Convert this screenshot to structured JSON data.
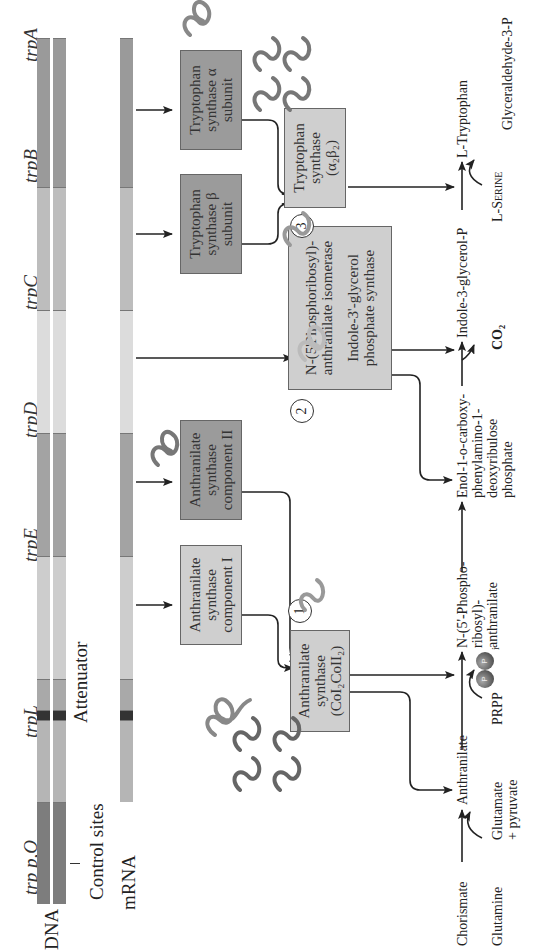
{
  "figure": {
    "orientation": "rotated-90-ccw",
    "dna": {
      "label": "DNA",
      "genes": [
        {
          "id": "trpPO",
          "label": "trp p,O",
          "color": "#7d7d7d"
        },
        {
          "id": "trpL",
          "label": "trpL",
          "color": "#b5b5b5"
        },
        {
          "id": "attenuator",
          "label": "",
          "color": "#333333"
        },
        {
          "id": "trpL2",
          "label": "",
          "color": "#a9a9a9"
        },
        {
          "id": "trpE",
          "label": "trpE",
          "color": "#cdcdcd"
        },
        {
          "id": "trpD",
          "label": "trpD",
          "color": "#a3a3a3"
        },
        {
          "id": "trpC",
          "label": "trpC",
          "color": "#dcdcdc"
        },
        {
          "id": "trpB",
          "label": "trpB",
          "color": "#bdbdbd"
        },
        {
          "id": "trpA",
          "label": "trpA",
          "color": "#9a9a9a"
        }
      ],
      "control_sites_label": "Control sites",
      "attenuator_label": "Attenuator"
    },
    "mrna": {
      "label": "mRNA"
    },
    "enzymes": {
      "as_comp1": "Anthranilate synthase component I",
      "as_comp2": "Anthranilate synthase component II",
      "as_complex_l1": "Anthranilate",
      "as_complex_l2": "synthase",
      "as_complex_l3": "(CoI₂CoII₂)",
      "prai_l1": "N-(5'Phosphoribosyl)-",
      "prai_l2": "anthranilate isomerase",
      "igps_l1": "Indole-3'-glycerol",
      "igps_l2": "phosphate synthase",
      "ts_beta": "Tryptophan synthase β subunit",
      "ts_alpha": "Tryptophan synthase α subunit",
      "ts_complex_l1": "Tryptophan",
      "ts_complex_l2": "synthase",
      "ts_complex_l3": "(α₂β₂)"
    },
    "step_numbers": [
      "1",
      "2",
      "3"
    ],
    "pathway": {
      "chorismate": "Chorismate",
      "glutamine": "Glutamine",
      "glutamate_l1": "Glutamate",
      "glutamate_l2": "+ pyruvate",
      "anthranilate": "Anthranilate",
      "prpp": "PRPP",
      "ppi": "P",
      "ppi_sub": "i",
      "pra_l1": "N-(5'-Phospho-",
      "pra_l2": "ribosyl)-",
      "pra_l3": "anthranilate",
      "cdrp_l1": "Enol-1-o-carboxy-",
      "cdrp_l2": "phenylamino-1-",
      "cdrp_l3": "deoxyribulose",
      "cdrp_l4": "phosphate",
      "co2": "CO₂",
      "igp": "Indole-3-glycerol-P",
      "serine": "L-Serine",
      "g3p": "Glyceraldehyde-3-P",
      "tryptophan": "L-Tryptophan"
    }
  }
}
